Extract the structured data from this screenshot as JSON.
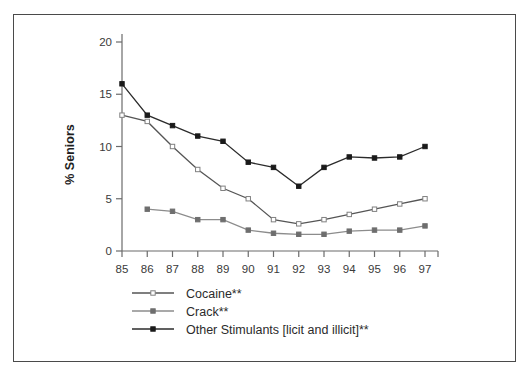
{
  "chart_data": {
    "type": "line",
    "title": "",
    "xlabel": "",
    "ylabel": "% Seniors",
    "x": [
      "85",
      "86",
      "87",
      "88",
      "89",
      "90",
      "91",
      "92",
      "93",
      "94",
      "95",
      "96",
      "97"
    ],
    "xtick_labels": [
      "85",
      "86",
      "87",
      "88",
      "89",
      "90",
      "91",
      "92",
      "93",
      "94",
      "95",
      "96",
      "97"
    ],
    "ytick_labels": [
      "0",
      "5",
      "10",
      "15",
      "20"
    ],
    "yticks": [
      0,
      5,
      10,
      15,
      20
    ],
    "ylim": [
      0,
      20
    ],
    "grid": false,
    "legend_position": "bottom-left",
    "series": [
      {
        "name": "Cocaine**",
        "marker": "open-square",
        "marker_fill": "#ffffff",
        "marker_edge": "#808080",
        "line_color": "#555555",
        "values": [
          13,
          12.4,
          10,
          7.8,
          6,
          5,
          3,
          2.6,
          3,
          3.5,
          4,
          4.5,
          5
        ]
      },
      {
        "name": "Crack**",
        "marker": "filled-square",
        "marker_fill": "#6e6e6e",
        "marker_edge": "#6e6e6e",
        "line_color": "#8c8c8c",
        "values": [
          null,
          4,
          3.8,
          3,
          3,
          2,
          1.7,
          1.6,
          1.6,
          1.9,
          2,
          2,
          2.4
        ]
      },
      {
        "name": "Other Stimulants [licit and illicit]**",
        "marker": "filled-square",
        "marker_fill": "#1a1a1a",
        "marker_edge": "#1a1a1a",
        "line_color": "#2b2b2b",
        "values": [
          16,
          13,
          12,
          11,
          10.5,
          8.5,
          8,
          6.2,
          8,
          9,
          8.9,
          9,
          10
        ]
      }
    ]
  },
  "legend": {
    "items": [
      {
        "label": "Cocaine**"
      },
      {
        "label": "Crack**"
      },
      {
        "label": "Other Stimulants [licit and illicit]**"
      }
    ]
  },
  "axis": {
    "y_title": "% Seniors"
  },
  "colors": {
    "frame": "#4a4a4a",
    "axis": "#6b6b6b",
    "background": "#ffffff",
    "cocaine": "#555555",
    "crack": "#8c8c8c",
    "other_stimulants": "#2b2b2b"
  }
}
